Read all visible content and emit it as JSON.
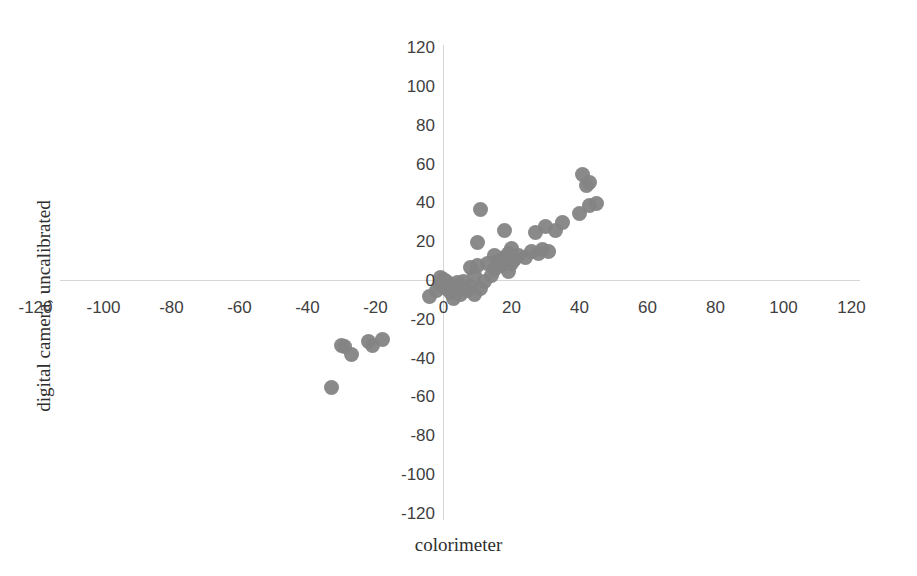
{
  "chart_data": {
    "type": "scatter",
    "title": "",
    "xlabel": "colorimeter",
    "ylabel": "digital camera, uncalibrated",
    "xlim": [
      -130,
      130
    ],
    "ylim": [
      -130,
      130
    ],
    "xticks": [
      -120,
      -100,
      -80,
      -60,
      -40,
      -20,
      0,
      20,
      40,
      60,
      80,
      100,
      120
    ],
    "yticks": [
      120,
      100,
      80,
      60,
      40,
      20,
      0,
      -20,
      -40,
      -60,
      -80,
      -100,
      -120
    ],
    "xtick_labels": [
      "-120",
      "-100",
      "-80",
      "-60",
      "-40",
      "-20",
      "0",
      "20",
      "40",
      "60",
      "80",
      "100",
      "120"
    ],
    "ytick_labels": [
      "120",
      "100",
      "80",
      "60",
      "40",
      "20",
      "0",
      "-20",
      "-40",
      "-60",
      "-80",
      "-100",
      "-120"
    ],
    "grid": false,
    "legend": false,
    "marker_color": "#848484",
    "axis_color": "#d6d6d6",
    "series": [
      {
        "name": "samples",
        "points": [
          [
            -33,
            -55
          ],
          [
            -30,
            -33
          ],
          [
            -29,
            -34
          ],
          [
            -27,
            -38
          ],
          [
            -22,
            -31
          ],
          [
            -21,
            -33
          ],
          [
            -18,
            -30
          ],
          [
            -4,
            -8
          ],
          [
            -2,
            -5
          ],
          [
            -1,
            -2
          ],
          [
            -1,
            2
          ],
          [
            0,
            -3
          ],
          [
            0,
            1
          ],
          [
            1,
            -4
          ],
          [
            1,
            0
          ],
          [
            2,
            -6
          ],
          [
            2,
            -2
          ],
          [
            3,
            -9
          ],
          [
            3,
            -4
          ],
          [
            4,
            -5
          ],
          [
            4,
            -1
          ],
          [
            5,
            -7
          ],
          [
            5,
            -3
          ],
          [
            6,
            -4
          ],
          [
            6,
            0
          ],
          [
            7,
            -5
          ],
          [
            8,
            -3
          ],
          [
            8,
            7
          ],
          [
            9,
            -7
          ],
          [
            9,
            3
          ],
          [
            10,
            20
          ],
          [
            10,
            8
          ],
          [
            11,
            -4
          ],
          [
            11,
            37
          ],
          [
            12,
            0
          ],
          [
            13,
            9
          ],
          [
            14,
            3
          ],
          [
            15,
            13
          ],
          [
            15,
            6
          ],
          [
            16,
            10
          ],
          [
            17,
            8
          ],
          [
            18,
            26
          ],
          [
            18,
            12
          ],
          [
            19,
            5
          ],
          [
            19,
            14
          ],
          [
            20,
            9
          ],
          [
            20,
            17
          ],
          [
            21,
            11
          ],
          [
            22,
            13
          ],
          [
            24,
            12
          ],
          [
            26,
            15
          ],
          [
            27,
            25
          ],
          [
            28,
            14
          ],
          [
            29,
            16
          ],
          [
            30,
            28
          ],
          [
            31,
            15
          ],
          [
            33,
            26
          ],
          [
            35,
            30
          ],
          [
            40,
            35
          ],
          [
            41,
            55
          ],
          [
            42,
            49
          ],
          [
            43,
            51
          ],
          [
            43,
            39
          ],
          [
            45,
            40
          ]
        ]
      }
    ]
  },
  "axes": {
    "x_title": "colorimeter",
    "y_title": "digital camera, uncalibrated"
  }
}
